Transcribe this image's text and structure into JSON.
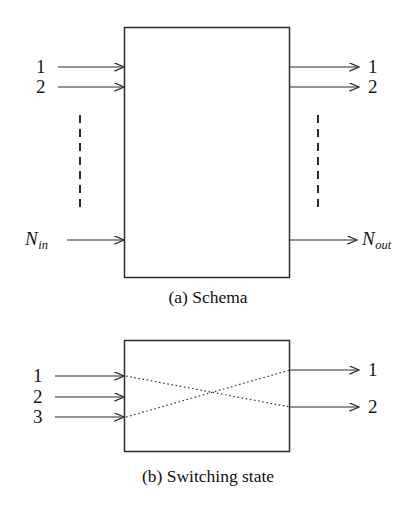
{
  "figure": {
    "background_color": "#ffffff",
    "line_color": "#2b2b2b",
    "text_color": "#161616",
    "panels": [
      {
        "id": "schema",
        "caption": "(a) Schema",
        "box": {
          "x": 124,
          "y": 27,
          "width": 166,
          "height": 251
        },
        "inputs": [
          {
            "label": "1",
            "y": 67
          },
          {
            "label": "2",
            "y": 87
          },
          {
            "label": "N_in",
            "base": "N",
            "subscript": "in",
            "y": 240
          }
        ],
        "outputs": [
          {
            "label": "1",
            "y": 67
          },
          {
            "label": "2",
            "y": 87
          },
          {
            "label": "N_out",
            "base": "N",
            "subscript": "out",
            "y": 240
          }
        ],
        "ellipsis_left": {
          "x": 80,
          "y1": 115,
          "y2": 210
        },
        "ellipsis_right": {
          "x": 318,
          "y1": 115,
          "y2": 210
        }
      },
      {
        "id": "switching-state",
        "caption": "(b) Switching state",
        "box": {
          "x": 124,
          "y": 340,
          "width": 166,
          "height": 112
        },
        "inputs": [
          {
            "label": "1",
            "y": 376
          },
          {
            "label": "2",
            "y": 397
          },
          {
            "label": "3",
            "y": 417
          }
        ],
        "outputs": [
          {
            "label": "1",
            "y": 370
          },
          {
            "label": "2",
            "y": 407
          }
        ],
        "connections": [
          {
            "from_input": "1",
            "to_output": "2",
            "x1": 124,
            "y1": 376,
            "x2": 290,
            "y2": 407
          },
          {
            "from_input": "3",
            "to_output": "1",
            "x1": 124,
            "y1": 417,
            "x2": 290,
            "y2": 370
          }
        ]
      }
    ]
  },
  "labels": {
    "a_in_1": "1",
    "a_in_2": "2",
    "a_in_n_base": "N",
    "a_in_n_sub": "in",
    "a_out_1": "1",
    "a_out_2": "2",
    "a_out_n_base": "N",
    "a_out_n_sub": "out",
    "b_in_1": "1",
    "b_in_2": "2",
    "b_in_3": "3",
    "b_out_1": "1",
    "b_out_2": "2"
  },
  "captions": {
    "a": "(a) Schema",
    "b": "(b) Switching state"
  }
}
